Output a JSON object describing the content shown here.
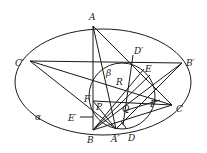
{
  "diagram": {
    "ellipse": {
      "cx": 103,
      "cy": 82,
      "rx": 88,
      "ry": 53
    },
    "circle": {
      "cx": 122,
      "cy": 96,
      "r": 33
    },
    "points": {
      "A": [
        93,
        26
      ],
      "B": [
        93,
        130
      ],
      "C": [
        172,
        105
      ],
      "A_prime": [
        116,
        129
      ],
      "B_prime": [
        182,
        63
      ],
      "C_prime": [
        30,
        61
      ],
      "D_prime": [
        130,
        61
      ],
      "E": [
        144,
        69
      ],
      "R": [
        124,
        87
      ],
      "F": [
        93,
        101
      ],
      "P": [
        103,
        109
      ],
      "Q": [
        124,
        111
      ],
      "F_prime": [
        150,
        104
      ],
      "D": [
        123,
        125
      ],
      "E_prime": [
        93,
        117
      ]
    },
    "labels": {
      "A": "A",
      "B": "B",
      "C": "C",
      "A_prime": "A′",
      "B_prime": "B′",
      "C_prime": "C′",
      "D": "D",
      "D_prime": "D′",
      "E": "E",
      "E_prime": "E′",
      "F": "F",
      "F_prime": "F′",
      "P": "P",
      "Q": "Q",
      "R": "R",
      "alpha": "α",
      "beta": "β"
    },
    "colors": {
      "stroke": "#1a1a1a",
      "background": "#ffffff"
    }
  }
}
